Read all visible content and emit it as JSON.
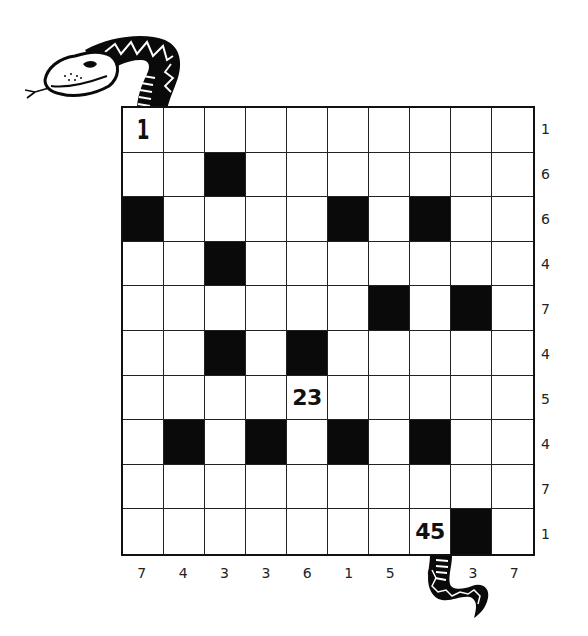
{
  "puzzle": {
    "type": "snake-number-grid",
    "rows": 10,
    "cols": 10,
    "start_label": "1",
    "cells": [
      [
        "1",
        "",
        "",
        "",
        "",
        "",
        "",
        "",
        "",
        ""
      ],
      [
        "",
        "",
        "#",
        "",
        "",
        "",
        "",
        "",
        "",
        ""
      ],
      [
        "#",
        "",
        "",
        "",
        "",
        "#",
        "",
        "#",
        "",
        ""
      ],
      [
        "",
        "",
        "#",
        "",
        "",
        "",
        "",
        "",
        "",
        ""
      ],
      [
        "",
        "",
        "",
        "",
        "",
        "",
        "#",
        "",
        "#",
        ""
      ],
      [
        "",
        "",
        "#",
        "",
        "#",
        "",
        "",
        "",
        "",
        ""
      ],
      [
        "",
        "",
        "",
        "",
        "23",
        "",
        "",
        "",
        "",
        ""
      ],
      [
        "",
        "#",
        "",
        "#",
        "",
        "#",
        "",
        "#",
        "",
        ""
      ],
      [
        "",
        "",
        "",
        "",
        "",
        "",
        "",
        "",
        "",
        ""
      ],
      [
        "",
        "",
        "",
        "",
        "",
        "",
        "",
        "45",
        "#",
        ""
      ]
    ],
    "row_clues": [
      "1",
      "6",
      "6",
      "4",
      "7",
      "4",
      "5",
      "4",
      "7",
      "1"
    ],
    "col_clues": [
      "7",
      "4",
      "3",
      "3",
      "6",
      "1",
      "5",
      "6",
      "3",
      "7"
    ]
  },
  "decorations": {
    "snake_head_icon": "snake-head-icon",
    "snake_tail_icon": "snake-tail-icon"
  },
  "colors": {
    "grid_line": "#222222",
    "black_cell": "#0a0a0a",
    "background": "#ffffff"
  }
}
